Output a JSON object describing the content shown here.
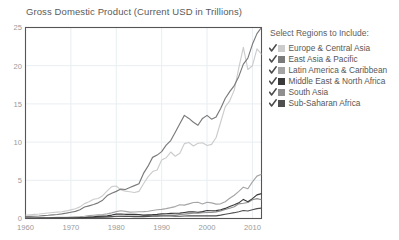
{
  "chart_data": {
    "type": "line",
    "title": "Gross Domestic Product (Current USD in Trillions)",
    "xlabel": "",
    "ylabel": "",
    "xlim": [
      1960,
      2012
    ],
    "ylim": [
      0,
      25
    ],
    "xticks": [
      1960,
      1970,
      1980,
      1990,
      2000,
      2010
    ],
    "xticklabels": [
      "1960",
      "1970",
      "1980",
      "1990",
      "2000",
      "2010"
    ],
    "yticks": [
      0,
      5,
      10,
      15,
      20,
      25
    ],
    "yticklabels": [
      "0",
      "5",
      "10",
      "15",
      "20",
      "25"
    ],
    "grid": true,
    "legend_position": "right",
    "x": [
      1960,
      1961,
      1962,
      1963,
      1964,
      1965,
      1966,
      1967,
      1968,
      1969,
      1970,
      1971,
      1972,
      1973,
      1974,
      1975,
      1976,
      1977,
      1978,
      1979,
      1980,
      1981,
      1982,
      1983,
      1984,
      1985,
      1986,
      1987,
      1988,
      1989,
      1990,
      1991,
      1992,
      1993,
      1994,
      1995,
      1996,
      1997,
      1998,
      1999,
      2000,
      2001,
      2002,
      2003,
      2004,
      2005,
      2006,
      2007,
      2008,
      2009,
      2010,
      2011,
      2012
    ],
    "series": [
      {
        "name": "Europe & Central Asia",
        "color": "#cccccc",
        "values": [
          0.45,
          0.49,
          0.54,
          0.59,
          0.66,
          0.72,
          0.79,
          0.84,
          0.88,
          0.99,
          1.13,
          1.27,
          1.52,
          1.95,
          2.2,
          2.52,
          2.62,
          2.98,
          3.62,
          4.18,
          4.25,
          3.75,
          3.58,
          3.5,
          3.4,
          3.55,
          4.55,
          5.45,
          6.15,
          6.35,
          7.65,
          7.95,
          8.7,
          8.15,
          8.55,
          9.8,
          9.95,
          9.5,
          9.85,
          9.9,
          9.55,
          9.7,
          10.6,
          12.6,
          14.6,
          15.4,
          16.8,
          19.7,
          22.4,
          19.5,
          20.0,
          22.2,
          21.5
        ]
      },
      {
        "name": "East Asia & Pacific",
        "color": "#7a7a7a",
        "values": [
          0.26,
          0.28,
          0.3,
          0.33,
          0.38,
          0.42,
          0.48,
          0.53,
          0.6,
          0.7,
          0.82,
          0.93,
          1.15,
          1.5,
          1.66,
          1.83,
          2.05,
          2.4,
          3.0,
          3.3,
          3.55,
          3.85,
          3.8,
          4.05,
          4.3,
          4.55,
          5.9,
          6.85,
          8.0,
          8.3,
          8.75,
          9.6,
          10.2,
          11.3,
          12.4,
          13.5,
          13.1,
          12.6,
          12.2,
          13.1,
          13.5,
          13.0,
          13.3,
          14.4,
          15.7,
          16.6,
          17.4,
          18.6,
          20.2,
          21.0,
          22.8,
          24.2,
          25.0
        ]
      },
      {
        "name": "Latin America & Caribbean",
        "color": "#a5a5a5",
        "values": [
          0.08,
          0.09,
          0.09,
          0.1,
          0.11,
          0.12,
          0.13,
          0.14,
          0.15,
          0.17,
          0.19,
          0.21,
          0.24,
          0.3,
          0.38,
          0.42,
          0.47,
          0.53,
          0.61,
          0.74,
          0.9,
          1.02,
          0.94,
          0.83,
          0.85,
          0.89,
          0.9,
          0.95,
          1.05,
          1.15,
          1.2,
          1.3,
          1.42,
          1.56,
          1.8,
          1.75,
          1.92,
          2.1,
          2.12,
          1.9,
          2.13,
          2.05,
          1.88,
          1.92,
          2.2,
          2.65,
          3.05,
          3.55,
          4.1,
          3.9,
          4.8,
          5.55,
          5.8
        ]
      },
      {
        "name": "Middle East & North Africa",
        "color": "#3a3a3a",
        "values": [
          0.02,
          0.02,
          0.02,
          0.03,
          0.03,
          0.03,
          0.04,
          0.04,
          0.05,
          0.05,
          0.06,
          0.07,
          0.09,
          0.12,
          0.2,
          0.23,
          0.28,
          0.32,
          0.35,
          0.45,
          0.58,
          0.58,
          0.55,
          0.55,
          0.54,
          0.53,
          0.45,
          0.48,
          0.5,
          0.54,
          0.62,
          0.62,
          0.67,
          0.68,
          0.7,
          0.78,
          0.86,
          0.89,
          0.82,
          0.9,
          1.05,
          1.02,
          1.03,
          1.14,
          1.32,
          1.58,
          1.8,
          2.05,
          2.5,
          2.2,
          2.6,
          3.1,
          3.25
        ]
      },
      {
        "name": "South Asia",
        "color": "#8f8f8f",
        "values": [
          0.05,
          0.05,
          0.05,
          0.06,
          0.07,
          0.07,
          0.07,
          0.08,
          0.08,
          0.09,
          0.1,
          0.1,
          0.11,
          0.13,
          0.15,
          0.16,
          0.16,
          0.19,
          0.22,
          0.24,
          0.26,
          0.28,
          0.29,
          0.31,
          0.31,
          0.33,
          0.35,
          0.39,
          0.42,
          0.43,
          0.47,
          0.43,
          0.44,
          0.45,
          0.52,
          0.58,
          0.64,
          0.68,
          0.7,
          0.75,
          0.79,
          0.81,
          0.86,
          1.0,
          1.17,
          1.35,
          1.54,
          1.92,
          2.0,
          2.1,
          2.45,
          2.6,
          2.45
        ]
      },
      {
        "name": "Sub-Saharan Africa",
        "color": "#4f4f4f",
        "values": [
          0.03,
          0.03,
          0.03,
          0.04,
          0.04,
          0.04,
          0.05,
          0.05,
          0.05,
          0.06,
          0.07,
          0.07,
          0.08,
          0.1,
          0.13,
          0.15,
          0.16,
          0.18,
          0.2,
          0.24,
          0.29,
          0.29,
          0.27,
          0.26,
          0.25,
          0.24,
          0.25,
          0.28,
          0.3,
          0.31,
          0.33,
          0.33,
          0.33,
          0.31,
          0.3,
          0.33,
          0.34,
          0.36,
          0.34,
          0.34,
          0.35,
          0.34,
          0.35,
          0.44,
          0.55,
          0.66,
          0.76,
          0.89,
          1.05,
          0.98,
          1.15,
          1.3,
          1.35
        ]
      }
    ]
  },
  "legend": {
    "title": "Select Regions to Include:",
    "items": [
      {
        "label": "Europe & Central Asia",
        "color": "#cccccc",
        "checked": true,
        "icon": "check-icon"
      },
      {
        "label": "East Asia & Pacific",
        "color": "#7a7a7a",
        "checked": true,
        "icon": "check-icon"
      },
      {
        "label": "Latin America & Caribbean",
        "color": "#a5a5a5",
        "checked": true,
        "icon": "check-icon"
      },
      {
        "label": "Middle East & North Africa",
        "color": "#3a3a3a",
        "checked": true,
        "icon": "check-icon"
      },
      {
        "label": "South Asia",
        "color": "#8f8f8f",
        "checked": true,
        "icon": "check-icon"
      },
      {
        "label": "Sub-Saharan Africa",
        "color": "#4f4f4f",
        "checked": true,
        "icon": "check-icon"
      }
    ]
  },
  "style": {
    "axis_color": "#555555",
    "grid_color": "#e8eef2",
    "tick_label_color": "#9a9a9a",
    "title_color": "#5a5a5a",
    "background": "#ffffff"
  }
}
